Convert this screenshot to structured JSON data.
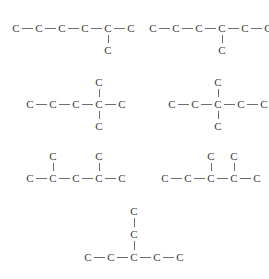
{
  "diagram": {
    "background_color": "#ffffff",
    "atom_color": "#3a3a3a",
    "bond_color": "#6e6e6e",
    "atom_symbol": "C",
    "bond_length_px": 23,
    "vertical_bond_px": 22
  },
  "structures": [
    {
      "id": "structure-1",
      "name": "2-methylhexane-skeleton",
      "position": {
        "x": 16,
        "y": 14
      },
      "chain_length": 6,
      "atoms": [
        {
          "label": "C",
          "x": 0,
          "y": 14
        },
        {
          "label": "C",
          "x": 23,
          "y": 14
        },
        {
          "label": "C",
          "x": 46,
          "y": 14
        },
        {
          "label": "C",
          "x": 69,
          "y": 14
        },
        {
          "label": "C",
          "x": 92,
          "y": 14
        },
        {
          "label": "C",
          "x": 115,
          "y": 14
        },
        {
          "label": "C",
          "x": 92,
          "y": 36
        }
      ],
      "bonds": [
        {
          "from": 0,
          "to": 1
        },
        {
          "from": 1,
          "to": 2
        },
        {
          "from": 2,
          "to": 3
        },
        {
          "from": 3,
          "to": 4
        },
        {
          "from": 4,
          "to": 5
        },
        {
          "from": 4,
          "to": 6
        }
      ],
      "branches": [
        {
          "at_chain_index": 4,
          "direction": "down",
          "size": 1
        }
      ]
    },
    {
      "id": "structure-2",
      "name": "3-methylhexane-skeleton",
      "position": {
        "x": 153,
        "y": 14
      },
      "chain_length": 6,
      "atoms": [
        {
          "label": "C",
          "x": 0,
          "y": 14
        },
        {
          "label": "C",
          "x": 23,
          "y": 14
        },
        {
          "label": "C",
          "x": 46,
          "y": 14
        },
        {
          "label": "C",
          "x": 69,
          "y": 14
        },
        {
          "label": "C",
          "x": 92,
          "y": 14
        },
        {
          "label": "C",
          "x": 115,
          "y": 14
        },
        {
          "label": "C",
          "x": 69,
          "y": 36
        }
      ],
      "bonds": [
        {
          "from": 0,
          "to": 1
        },
        {
          "from": 1,
          "to": 2
        },
        {
          "from": 2,
          "to": 3
        },
        {
          "from": 3,
          "to": 4
        },
        {
          "from": 4,
          "to": 5
        },
        {
          "from": 3,
          "to": 6
        }
      ],
      "branches": [
        {
          "at_chain_index": 3,
          "direction": "down",
          "size": 1
        }
      ]
    },
    {
      "id": "structure-3",
      "name": "2-2-dimethylpentane-skeleton",
      "position": {
        "x": 30,
        "y": 78
      },
      "chain_length": 5,
      "atoms": [
        {
          "label": "C",
          "x": 0,
          "y": 26
        },
        {
          "label": "C",
          "x": 23,
          "y": 26
        },
        {
          "label": "C",
          "x": 46,
          "y": 26
        },
        {
          "label": "C",
          "x": 69,
          "y": 26
        },
        {
          "label": "C",
          "x": 92,
          "y": 26
        },
        {
          "label": "C",
          "x": 69,
          "y": 4
        },
        {
          "label": "C",
          "x": 69,
          "y": 48
        }
      ],
      "bonds": [
        {
          "from": 0,
          "to": 1
        },
        {
          "from": 1,
          "to": 2
        },
        {
          "from": 2,
          "to": 3
        },
        {
          "from": 3,
          "to": 4
        },
        {
          "from": 3,
          "to": 5
        },
        {
          "from": 3,
          "to": 6
        }
      ],
      "branches": [
        {
          "at_chain_index": 3,
          "direction": "up",
          "size": 1
        },
        {
          "at_chain_index": 3,
          "direction": "down",
          "size": 1
        }
      ]
    },
    {
      "id": "structure-4",
      "name": "3-3-dimethylpentane-skeleton",
      "position": {
        "x": 172,
        "y": 78
      },
      "chain_length": 5,
      "atoms": [
        {
          "label": "C",
          "x": 0,
          "y": 26
        },
        {
          "label": "C",
          "x": 23,
          "y": 26
        },
        {
          "label": "C",
          "x": 46,
          "y": 26
        },
        {
          "label": "C",
          "x": 69,
          "y": 26
        },
        {
          "label": "C",
          "x": 92,
          "y": 26
        },
        {
          "label": "C",
          "x": 46,
          "y": 4
        },
        {
          "label": "C",
          "x": 46,
          "y": 48
        }
      ],
      "bonds": [
        {
          "from": 0,
          "to": 1
        },
        {
          "from": 1,
          "to": 2
        },
        {
          "from": 2,
          "to": 3
        },
        {
          "from": 3,
          "to": 4
        },
        {
          "from": 2,
          "to": 5
        },
        {
          "from": 2,
          "to": 6
        }
      ],
      "branches": [
        {
          "at_chain_index": 2,
          "direction": "up",
          "size": 1
        },
        {
          "at_chain_index": 2,
          "direction": "down",
          "size": 1
        }
      ]
    },
    {
      "id": "structure-5",
      "name": "2-4-dimethylpentane-skeleton",
      "position": {
        "x": 30,
        "y": 152
      },
      "chain_length": 5,
      "atoms": [
        {
          "label": "C",
          "x": 0,
          "y": 26
        },
        {
          "label": "C",
          "x": 23,
          "y": 26
        },
        {
          "label": "C",
          "x": 46,
          "y": 26
        },
        {
          "label": "C",
          "x": 69,
          "y": 26
        },
        {
          "label": "C",
          "x": 92,
          "y": 26
        },
        {
          "label": "C",
          "x": 23,
          "y": 4
        },
        {
          "label": "C",
          "x": 69,
          "y": 4
        }
      ],
      "bonds": [
        {
          "from": 0,
          "to": 1
        },
        {
          "from": 1,
          "to": 2
        },
        {
          "from": 2,
          "to": 3
        },
        {
          "from": 3,
          "to": 4
        },
        {
          "from": 1,
          "to": 5
        },
        {
          "from": 3,
          "to": 6
        }
      ],
      "branches": [
        {
          "at_chain_index": 1,
          "direction": "up",
          "size": 1
        },
        {
          "at_chain_index": 3,
          "direction": "up",
          "size": 1
        }
      ]
    },
    {
      "id": "structure-6",
      "name": "2-3-dimethylpentane-skeleton",
      "position": {
        "x": 165,
        "y": 152
      },
      "chain_length": 5,
      "atoms": [
        {
          "label": "C",
          "x": 0,
          "y": 26
        },
        {
          "label": "C",
          "x": 23,
          "y": 26
        },
        {
          "label": "C",
          "x": 46,
          "y": 26
        },
        {
          "label": "C",
          "x": 69,
          "y": 26
        },
        {
          "label": "C",
          "x": 92,
          "y": 26
        },
        {
          "label": "C",
          "x": 46,
          "y": 4
        },
        {
          "label": "C",
          "x": 69,
          "y": 4
        }
      ],
      "bonds": [
        {
          "from": 0,
          "to": 1
        },
        {
          "from": 1,
          "to": 2
        },
        {
          "from": 2,
          "to": 3
        },
        {
          "from": 3,
          "to": 4
        },
        {
          "from": 2,
          "to": 5
        },
        {
          "from": 3,
          "to": 6
        }
      ],
      "branches": [
        {
          "at_chain_index": 2,
          "direction": "up",
          "size": 1
        },
        {
          "at_chain_index": 3,
          "direction": "up",
          "size": 1
        }
      ]
    },
    {
      "id": "structure-7",
      "name": "3-ethylpentane-skeleton",
      "position": {
        "x": 88,
        "y": 206
      },
      "chain_length": 5,
      "atoms": [
        {
          "label": "C",
          "x": 0,
          "y": 51
        },
        {
          "label": "C",
          "x": 23,
          "y": 51
        },
        {
          "label": "C",
          "x": 46,
          "y": 51
        },
        {
          "label": "C",
          "x": 69,
          "y": 51
        },
        {
          "label": "C",
          "x": 92,
          "y": 51
        },
        {
          "label": "C",
          "x": 46,
          "y": 28
        },
        {
          "label": "C",
          "x": 46,
          "y": 5
        }
      ],
      "bonds": [
        {
          "from": 0,
          "to": 1
        },
        {
          "from": 1,
          "to": 2
        },
        {
          "from": 2,
          "to": 3
        },
        {
          "from": 3,
          "to": 4
        },
        {
          "from": 2,
          "to": 5
        },
        {
          "from": 5,
          "to": 6
        }
      ],
      "branches": [
        {
          "at_chain_index": 2,
          "direction": "up",
          "size": 2
        }
      ]
    }
  ]
}
